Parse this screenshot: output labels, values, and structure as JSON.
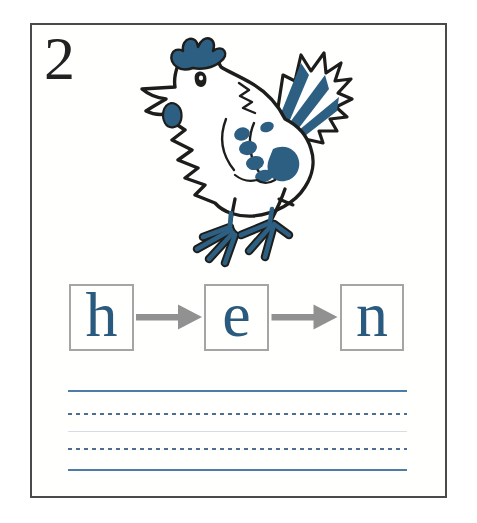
{
  "page": {
    "number": "2",
    "word": "hen"
  },
  "letter_boxes": {
    "letters": [
      "h",
      "e",
      "n"
    ]
  },
  "illustration": {
    "name": "hen-line-drawing",
    "description": "hand-drawn hen outline with blue accents"
  },
  "writing_area": {
    "line_styles": [
      "solid",
      "dashed",
      "faint",
      "dashed",
      "solid"
    ]
  },
  "colors": {
    "accent_blue": "#2d5f82",
    "letter_blue": "#2a5a7d",
    "arrow_gray": "#919191",
    "box_border": "#a5a5a5",
    "solid_line_blue": "#4f7ca6",
    "dashed_line_blue": "#4f6d92",
    "faint_line": "#d8dde3",
    "page_border": "#4a4a4a",
    "ink": "#1d1d1b"
  }
}
